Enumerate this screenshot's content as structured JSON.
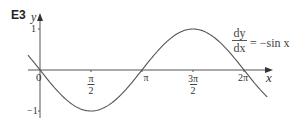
{
  "figure": {
    "id_label": "E3",
    "equation": {
      "numerator": "dy",
      "denominator": "dx",
      "rhs": "= −sin x"
    },
    "x_axis_label": "x",
    "y_axis_label": "y",
    "origin_label": "0",
    "y_ticks": [
      {
        "value": 1,
        "label": "1"
      },
      {
        "value": -1,
        "label": "−1"
      }
    ],
    "x_ticks": [
      {
        "value": 1.5708,
        "num": "π",
        "den": "2"
      },
      {
        "value": 3.1416,
        "num": "π",
        "den": ""
      },
      {
        "value": 4.7124,
        "num": "3π",
        "den": "2"
      },
      {
        "value": 6.2832,
        "num": "2π",
        "den": ""
      }
    ],
    "colors": {
      "axis": "#444444",
      "curve": "#555555",
      "text": "#333333"
    }
  },
  "chart_data": {
    "type": "line",
    "xlabel": "x",
    "ylabel": "y",
    "function": "y = -sin(x)",
    "xlim": [
      -0.37,
      7.0
    ],
    "ylim": [
      -1,
      1
    ],
    "x_tick_labels": [
      "0",
      "π/2",
      "π",
      "3π/2",
      "2π"
    ],
    "y_tick_labels": [
      "1",
      "−1"
    ],
    "grid": false,
    "legend": "none",
    "series": [
      {
        "name": "−sin x",
        "x": [
          -0.37,
          0,
          0.785,
          1.571,
          2.356,
          3.142,
          3.927,
          4.712,
          5.498,
          6.283,
          7.0
        ],
        "values": [
          0.36,
          0,
          -0.71,
          -1,
          -0.71,
          0,
          0.71,
          1,
          0.71,
          0,
          -0.66
        ]
      }
    ]
  }
}
